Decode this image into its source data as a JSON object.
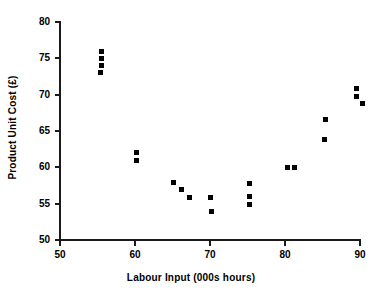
{
  "chart_data": {
    "type": "scatter",
    "title": "",
    "xlabel": "Labour Input (000s hours)",
    "ylabel": "Product Unit Cost (£)",
    "xlim": [
      50,
      90
    ],
    "ylim": [
      50,
      80
    ],
    "xticks": [
      50,
      60,
      70,
      80,
      90
    ],
    "yticks": [
      50,
      55,
      60,
      65,
      70,
      75,
      80
    ],
    "xtick_labels": [
      "50",
      "60",
      "70",
      "80",
      "90"
    ],
    "ytick_labels": [
      "50",
      "55",
      "60",
      "65",
      "70",
      "75",
      "80"
    ],
    "grid": false,
    "legend": null,
    "marker": "square",
    "marker_color": "#000000",
    "series": [
      {
        "name": "Product Unit Cost vs Labour Input",
        "points": [
          {
            "x": 55.5,
            "y": 76.0
          },
          {
            "x": 55.5,
            "y": 75.0
          },
          {
            "x": 55.5,
            "y": 74.0
          },
          {
            "x": 55.4,
            "y": 73.0
          },
          {
            "x": 60.2,
            "y": 62.0
          },
          {
            "x": 60.2,
            "y": 61.0
          },
          {
            "x": 65.1,
            "y": 57.9
          },
          {
            "x": 66.2,
            "y": 56.9
          },
          {
            "x": 67.2,
            "y": 55.9
          },
          {
            "x": 70.0,
            "y": 55.9
          },
          {
            "x": 70.2,
            "y": 53.9
          },
          {
            "x": 75.3,
            "y": 57.8
          },
          {
            "x": 75.3,
            "y": 56.0
          },
          {
            "x": 75.3,
            "y": 54.9
          },
          {
            "x": 80.3,
            "y": 60.0
          },
          {
            "x": 81.2,
            "y": 60.0
          },
          {
            "x": 85.4,
            "y": 66.6
          },
          {
            "x": 85.2,
            "y": 63.8
          },
          {
            "x": 89.5,
            "y": 70.8
          },
          {
            "x": 89.5,
            "y": 69.8
          },
          {
            "x": 90.3,
            "y": 68.8
          }
        ]
      }
    ]
  }
}
